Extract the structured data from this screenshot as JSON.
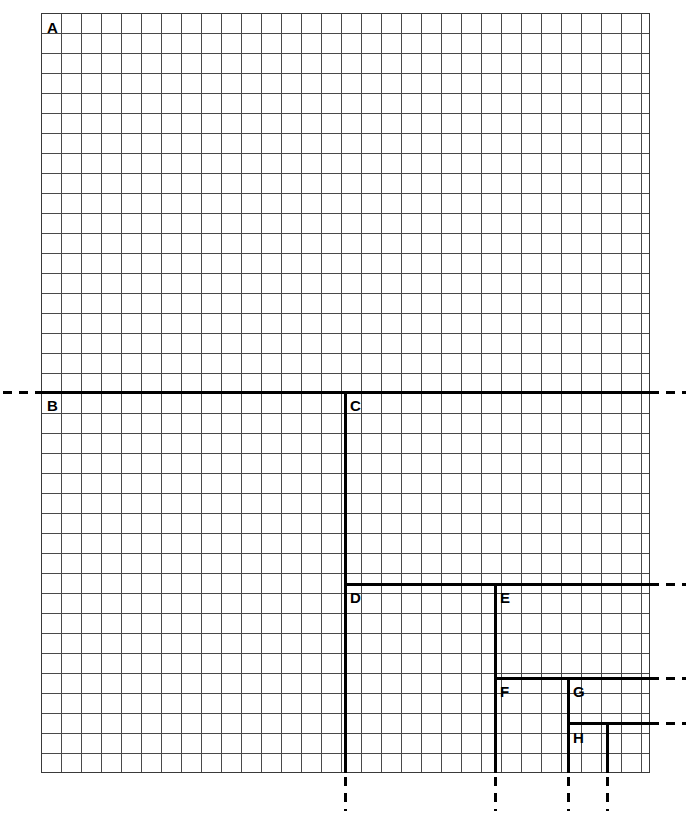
{
  "figure": {
    "kind": "engineering-grid-step-diagram",
    "background_color": "#ffffff",
    "grid": {
      "left": 41,
      "top": 13,
      "width": 609,
      "height": 760,
      "cell_size": 20,
      "columns": 30,
      "rows": 38,
      "line_color": "#4a4a4a",
      "border_color": "#3a3a3a"
    },
    "line_color": "#000000",
    "line_weight": 3
  },
  "labels": [
    {
      "id": "A",
      "text": "A",
      "x": 47,
      "y": 20
    },
    {
      "id": "B",
      "text": "B",
      "x": 47,
      "y": 398
    },
    {
      "id": "C",
      "text": "C",
      "x": 350,
      "y": 398
    },
    {
      "id": "D",
      "text": "D",
      "x": 350,
      "y": 590
    },
    {
      "id": "E",
      "text": "E",
      "x": 500,
      "y": 590
    },
    {
      "id": "F",
      "text": "F",
      "x": 500,
      "y": 684
    },
    {
      "id": "G",
      "text": "G",
      "x": 573,
      "y": 684
    },
    {
      "id": "H",
      "text": "H",
      "x": 573,
      "y": 730
    }
  ],
  "solid_horizontal_lines": [
    {
      "name": "line-b-c-right",
      "x": 41,
      "y": 391,
      "length": 609
    },
    {
      "name": "line-d-e-right",
      "x": 344,
      "y": 583,
      "length": 306
    },
    {
      "name": "line-f-g-right",
      "x": 494,
      "y": 677,
      "length": 156
    },
    {
      "name": "line-h-right",
      "x": 567,
      "y": 722,
      "length": 83
    }
  ],
  "solid_vertical_lines": [
    {
      "name": "line-c-down",
      "x": 344,
      "y": 391,
      "length": 382
    },
    {
      "name": "line-e-down",
      "x": 494,
      "y": 583,
      "length": 190
    },
    {
      "name": "line-g-down",
      "x": 567,
      "y": 677,
      "length": 96
    },
    {
      "name": "line-h-down",
      "x": 606,
      "y": 722,
      "length": 51
    }
  ],
  "dashed_extensions_horizontal": [
    {
      "name": "dash-left-b",
      "x": 3,
      "y": 391,
      "length": 38
    },
    {
      "name": "dash-right-b",
      "x": 650,
      "y": 391,
      "length": 36
    },
    {
      "name": "dash-right-d",
      "x": 650,
      "y": 583,
      "length": 36
    },
    {
      "name": "dash-right-f",
      "x": 650,
      "y": 677,
      "length": 36
    },
    {
      "name": "dash-right-h",
      "x": 650,
      "y": 722,
      "length": 36
    }
  ],
  "dashed_extensions_vertical": [
    {
      "name": "dash-down-c",
      "x": 344,
      "y": 777,
      "length": 34
    },
    {
      "name": "dash-down-e",
      "x": 494,
      "y": 777,
      "length": 34
    },
    {
      "name": "dash-down-g",
      "x": 567,
      "y": 777,
      "length": 34
    },
    {
      "name": "dash-down-h",
      "x": 606,
      "y": 777,
      "length": 34
    }
  ]
}
